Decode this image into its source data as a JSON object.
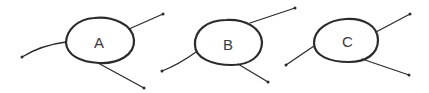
{
  "diagram": {
    "type": "hand-drawn node diagram",
    "nodes": [
      {
        "id": "A",
        "label": "A",
        "shape": "ellipse",
        "cx": 100,
        "cy": 42,
        "rx": 34,
        "ry": 23,
        "edges": [
          {
            "from": [
              22,
              57
            ],
            "to": [
              66,
              42
            ],
            "direction": "in"
          },
          {
            "from": [
              128,
              29
            ],
            "to": [
              163,
              14
            ],
            "direction": "out"
          },
          {
            "from": [
              98,
              64
            ],
            "to": [
              144,
              88
            ],
            "direction": "out"
          }
        ]
      },
      {
        "id": "B",
        "label": "B",
        "shape": "ellipse",
        "cx": 228,
        "cy": 44,
        "rx": 34,
        "ry": 24,
        "edges": [
          {
            "from": [
              251,
              23
            ],
            "to": [
              295,
              8
            ],
            "direction": "out"
          },
          {
            "from": [
              196,
              52
            ],
            "to": [
              162,
              71
            ],
            "direction": "out"
          },
          {
            "from": [
              238,
              64
            ],
            "to": [
              268,
              82
            ],
            "direction": "out"
          }
        ]
      },
      {
        "id": "C",
        "label": "C",
        "shape": "ellipse",
        "cx": 347,
        "cy": 41,
        "rx": 32,
        "ry": 22,
        "edges": [
          {
            "from": [
              314,
              46
            ],
            "to": [
              286,
              65
            ],
            "direction": "out"
          },
          {
            "from": [
              376,
              32
            ],
            "to": [
              410,
              14
            ],
            "direction": "out"
          },
          {
            "from": [
              362,
              59
            ],
            "to": [
              409,
              75
            ],
            "direction": "out"
          }
        ]
      }
    ],
    "stroke_color": "#2b2b2b",
    "background": "#ffffff"
  }
}
